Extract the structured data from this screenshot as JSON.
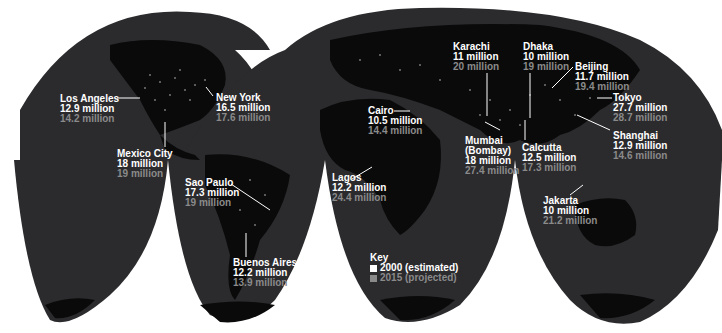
{
  "map": {
    "title": "Megacities population",
    "colors": {
      "ocean": "#2b2b2e",
      "land": "#0a0a0a",
      "lights": "#ffffff",
      "value_2000": "#ffffff",
      "value_2015": "#8a8a8a",
      "background": "#ffffff"
    },
    "cities": [
      {
        "name": "Los Angeles",
        "v2000": "12.9 million",
        "v2015": "14.2 million"
      },
      {
        "name": "New York",
        "v2000": "16.5 million",
        "v2015": "17.6 million"
      },
      {
        "name": "Mexico City",
        "v2000": "18 million",
        "v2015": "19 million"
      },
      {
        "name": "Sao Paulo",
        "v2000": "17.3 million",
        "v2015": "19 million"
      },
      {
        "name": "Buenos Aires",
        "v2000": "12.2 million",
        "v2015": "13.9 million"
      },
      {
        "name": "Cairo",
        "v2000": "10.5 million",
        "v2015": "14.4 million"
      },
      {
        "name": "Lagos",
        "v2000": "12.2 million",
        "v2015": "24.4 million"
      },
      {
        "name": "Karachi",
        "v2000": "11 million",
        "v2015": "20 million"
      },
      {
        "name": "Dhaka",
        "v2000": "10 million",
        "v2015": "19 million"
      },
      {
        "name": "Mumbai (Bombay)",
        "name_line1": "Mumbai",
        "name_line2": "(Bombay)",
        "v2000": "18 million",
        "v2015": "27.4 million"
      },
      {
        "name": "Calcutta",
        "v2000": "12.5 million",
        "v2015": "17.3 million"
      },
      {
        "name": "Beijing",
        "v2000": "11.7 million",
        "v2015": "19.4 million"
      },
      {
        "name": "Tokyo",
        "v2000": "27.7 million",
        "v2015": "28.7 million"
      },
      {
        "name": "Shanghai",
        "v2000": "12.9 million",
        "v2015": "14.6 million"
      },
      {
        "name": "Jakarta",
        "v2000": "10 million",
        "v2015": "21.2 million"
      }
    ],
    "key": {
      "title": "Key",
      "items": [
        {
          "label": "2000 (estimated)",
          "color": "#ffffff"
        },
        {
          "label": "2015 (projected)",
          "color": "#8a8a8a"
        }
      ]
    }
  }
}
